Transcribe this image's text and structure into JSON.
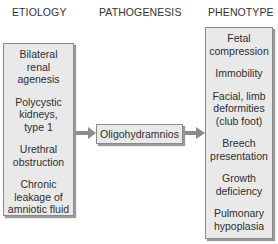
{
  "headers": {
    "etiology": "ETIOLOGY",
    "pathogenesis": "PATHOGENESIS",
    "phenotype": "PHENOTYPE"
  },
  "etiology": {
    "items": [
      {
        "lines": [
          "Bilateral",
          "renal",
          "agenesis"
        ]
      },
      {
        "lines": [
          "Polycystic",
          "kidneys,",
          "type 1"
        ]
      },
      {
        "lines": [
          "Urethral",
          "obstruction"
        ]
      },
      {
        "lines": [
          "Chronic",
          "leakage of",
          "amniotic fluid"
        ]
      }
    ]
  },
  "pathogenesis": {
    "label": "Oligohydramnios"
  },
  "phenotype": {
    "items": [
      {
        "lines": [
          "Fetal",
          "compression"
        ]
      },
      {
        "lines": [
          "Immobility"
        ]
      },
      {
        "lines": [
          "Facial, limb",
          "deformities",
          "(club foot)"
        ]
      },
      {
        "lines": [
          "Breech",
          "presentation"
        ]
      },
      {
        "lines": [
          "Growth",
          "deficiency"
        ]
      },
      {
        "lines": [
          "Pulmonary",
          "hypoplasia"
        ]
      }
    ]
  },
  "colors": {
    "box_fill": "#e9e9e9",
    "box_border": "#8a8a8a",
    "arrow": "#8c8c8c"
  }
}
